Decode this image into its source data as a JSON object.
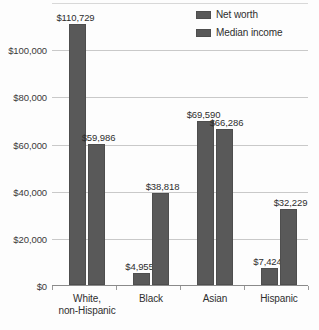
{
  "chart_data": {
    "type": "bar",
    "title": "",
    "subtitle": "",
    "xlabel": "",
    "ylabel": "",
    "categories": [
      "White,\nnon-Hispanic",
      "Black",
      "Asian",
      "Hispanic"
    ],
    "category_lines": [
      [
        "White,",
        "non-Hispanic"
      ],
      [
        "Black",
        ""
      ],
      [
        "Asian",
        ""
      ],
      [
        "Hispanic",
        ""
      ]
    ],
    "series": [
      {
        "name": "Net worth",
        "values": [
          110729,
          4955,
          69590,
          7424
        ],
        "labels": [
          "$110,729",
          "$4,955",
          "$69,590",
          "$7,424"
        ],
        "color": "#595959"
      },
      {
        "name": "Median income",
        "values": [
          59986,
          38818,
          66286,
          32229
        ],
        "labels": [
          "$59,986",
          "$38,818",
          "$66,286",
          "$32,229"
        ],
        "color": "#595959"
      }
    ],
    "ylim": [
      0,
      120000
    ],
    "yticks": [
      0,
      20000,
      40000,
      60000,
      80000,
      100000
    ],
    "ytick_labels": [
      "$0",
      "$20,000",
      "$40,000",
      "$60,000",
      "$80,000",
      "$100,000"
    ],
    "grid": true,
    "legend_position": "top-right",
    "legend_entries": [
      "Net worth",
      "Median income"
    ]
  },
  "legend": {
    "items": [
      {
        "label": "Net worth"
      },
      {
        "label": "Median income"
      }
    ]
  }
}
